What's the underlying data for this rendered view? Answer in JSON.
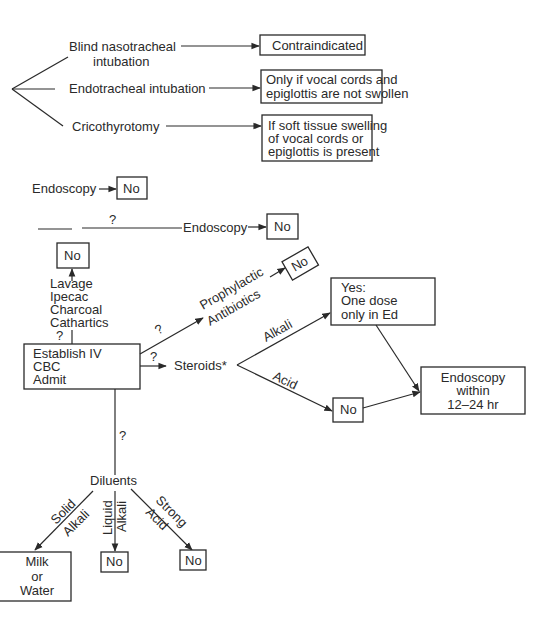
{
  "airway": {
    "options": [
      {
        "label_line1": "Blind nasotracheal",
        "label_line2": "intubation",
        "result": [
          "Contraindicated"
        ]
      },
      {
        "label_line1": "Endotracheal intubation",
        "result": [
          "Only if vocal cords and",
          "epiglottis are not swollen"
        ]
      },
      {
        "label_line1": "Cricothyrotomy",
        "result": [
          "If soft tissue swelling",
          "of vocal cords or",
          "epiglottis is present"
        ]
      }
    ]
  },
  "endoscopy_top": {
    "label": "Endoscopy",
    "result": "No"
  },
  "endoscopy_question": {
    "question": "?",
    "label": "Endoscopy",
    "result": "No"
  },
  "decontamination": {
    "result": "No",
    "items": [
      "Lavage",
      "Ipecac",
      "Charcoal",
      "Cathartics"
    ],
    "question": "?"
  },
  "main_box": {
    "lines": [
      "Establish IV",
      "CBC",
      "Admit"
    ]
  },
  "antibiotics": {
    "question": "?",
    "line1": "Prophylactic",
    "line2": "Antibiotics",
    "result": "No"
  },
  "steroids": {
    "question": "?",
    "label": "Steroids*",
    "alkali_label": "Alkali",
    "acid_label": "Acid",
    "alkali_result": [
      "Yes:",
      "One dose",
      "only in Ed"
    ],
    "acid_result": "No",
    "final": [
      "Endoscopy",
      "within",
      "12–24 hr"
    ]
  },
  "diluents": {
    "question": "?",
    "label": "Diluents",
    "branches": [
      {
        "line1": "Solid",
        "line2": "Alkali",
        "result": [
          "Milk",
          "or",
          "Water"
        ]
      },
      {
        "line1": "Liquid",
        "line2": "Alkali",
        "result": [
          "No"
        ]
      },
      {
        "line1": "Strong",
        "line2": "Acid",
        "result": [
          "No"
        ]
      }
    ]
  }
}
